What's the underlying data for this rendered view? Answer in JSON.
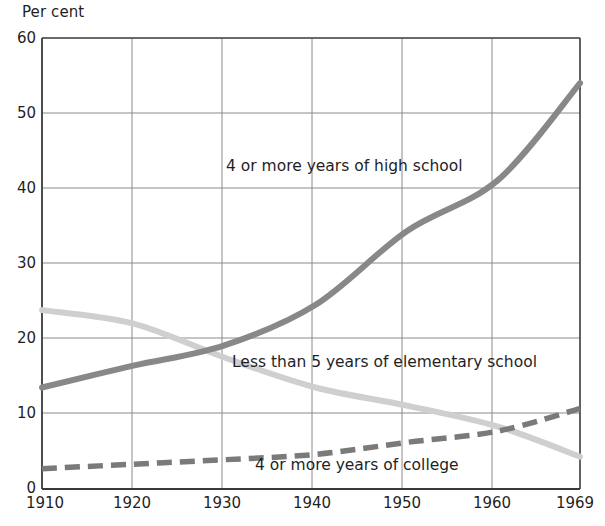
{
  "chart_data": {
    "type": "line",
    "title": "",
    "ylabel": "Per cent",
    "xlabel": "",
    "xlim": [
      1910,
      1969
    ],
    "ylim": [
      0,
      60
    ],
    "grid": true,
    "legend_position": "inline-annotations",
    "x_ticks": [
      "1910",
      "1920",
      "1930",
      "1940",
      "1950",
      "1960",
      "1969"
    ],
    "y_ticks": [
      "0",
      "10",
      "20",
      "30",
      "40",
      "50",
      "60"
    ],
    "x": [
      1910,
      1920,
      1930,
      1940,
      1950,
      1960,
      1969
    ],
    "series": [
      {
        "name": "4 or more years of high school",
        "style": "solid",
        "color": "#888888",
        "values": [
          13.5,
          16.4,
          19.1,
          24.5,
          34.3,
          41.1,
          54.0
        ]
      },
      {
        "name": "Less than 5 years of elementary school",
        "style": "solid",
        "color": "#cfcfcf",
        "values": [
          23.8,
          22.0,
          17.5,
          13.5,
          11.1,
          8.3,
          4.3
        ]
      },
      {
        "name": "4 or more years of college",
        "style": "dashed",
        "color": "#7a7a7a",
        "values": [
          2.7,
          3.3,
          3.9,
          4.6,
          6.2,
          7.7,
          10.7
        ]
      }
    ],
    "annotations": [
      {
        "text": "4 or more years of high school",
        "x": 1936,
        "y": 43
      },
      {
        "text": "Less than 5 years of elementary school",
        "x": 1936,
        "y": 17
      },
      {
        "text": "4 or more years of college",
        "x": 1941,
        "y": 4
      }
    ],
    "colors": {
      "axis": "#3a3a3a",
      "grid": "#7a7a7a",
      "text": "#1f1f1f",
      "background": "#ffffff"
    }
  }
}
